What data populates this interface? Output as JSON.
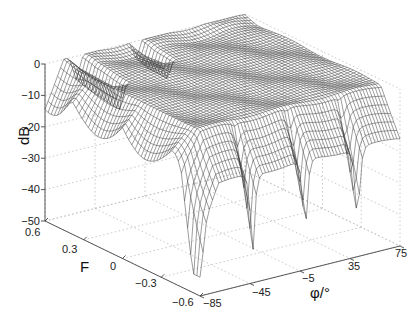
{
  "chart_data": {
    "type": "surface3d",
    "title": "",
    "xlabel": "φ/°",
    "ylabel": "F",
    "zlabel": "dB",
    "x_ticks": [
      -85,
      -45,
      -5,
      35,
      75
    ],
    "y_ticks": [
      0.6,
      0.3,
      0,
      -0.3,
      -0.6
    ],
    "z_ticks": [
      0,
      -10,
      -20,
      -30,
      -40,
      -50
    ],
    "xlim": [
      -85,
      75
    ],
    "ylim": [
      -0.6,
      0.6
    ],
    "zlim": [
      -50,
      0
    ],
    "grid": true,
    "grid_style": "dotted",
    "surface_style": "mesh, dark gray lines on white",
    "notable_points": [
      {
        "phi": -5,
        "F": -0.6,
        "dB": -41
      },
      {
        "phi": 25,
        "F": -0.6,
        "dB": -33
      },
      {
        "phi": 40,
        "F": -0.6,
        "dB": -35
      },
      {
        "phi": -45,
        "F": -0.6,
        "dB": -30
      },
      {
        "phi": -85,
        "F": 0.6,
        "dB": -2
      }
    ]
  },
  "labels": {
    "z": "dB",
    "y": "F",
    "x": "φ/°",
    "z_ticks": [
      "0",
      "−10",
      "−20",
      "−30",
      "−40",
      "−50"
    ],
    "y_ticks": [
      "0.6",
      "0.3",
      "0",
      "−0.3",
      "−0.6"
    ],
    "x_ticks": [
      "−85",
      "−45",
      "−5",
      "35",
      "75"
    ]
  }
}
